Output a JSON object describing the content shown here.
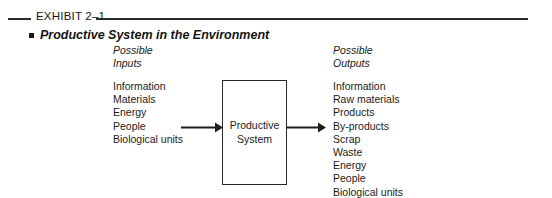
{
  "header": {
    "exhibit_label": "EXHIBIT 2–1",
    "title": "Productive System in the Environment",
    "bullet_icon": "square-bullet-icon"
  },
  "diagram": {
    "inputs": {
      "heading_line1": "Possible",
      "heading_line2": "Inputs",
      "items": [
        "Information",
        "Materials",
        "Energy",
        "People",
        "Biological units"
      ]
    },
    "process": {
      "label_line1": "Productive",
      "label_line2": "System"
    },
    "outputs": {
      "heading_line1": "Possible",
      "heading_line2": "Outputs",
      "items": [
        "Information",
        "Raw materials",
        "Products",
        "By-products",
        "Scrap",
        "Waste",
        "Energy",
        "People",
        "Biological units"
      ]
    },
    "arrow_in_icon": "arrow-right-icon",
    "arrow_out_icon": "arrow-right-icon"
  },
  "colors": {
    "ink": "#1a1a1a",
    "rule": "#2b2b2b",
    "background": "#ffffff"
  }
}
